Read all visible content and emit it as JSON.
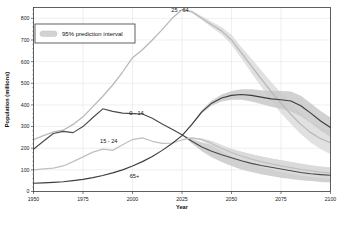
{
  "chart_data": {
    "type": "line",
    "title": "",
    "xlabel": "Year",
    "ylabel": "Population (millions)",
    "xlim": [
      1950,
      2100
    ],
    "ylim": [
      0,
      850
    ],
    "xticks": [
      1950,
      1975,
      2000,
      2025,
      2050,
      2075,
      2100
    ],
    "yticks": [
      0,
      100,
      200,
      300,
      400,
      500,
      600,
      700,
      800
    ],
    "grid": true,
    "legend": {
      "position": "top-left",
      "entries": [
        {
          "label": "95% prediction interval",
          "swatch_color": "#d2d2d2",
          "type": "band"
        }
      ]
    },
    "forecast_start": 2024,
    "annotations": [
      {
        "text": "25 - 64",
        "x": 2024,
        "y": 830,
        "series": "25 - 64"
      },
      {
        "text": "0 - 14",
        "x": 2002,
        "y": 352,
        "series": "0 - 14"
      },
      {
        "text": "15 - 24",
        "x": 1988,
        "y": 222,
        "series": "15 - 24"
      },
      {
        "text": "65+",
        "x": 2001,
        "y": 62,
        "series": "65+"
      }
    ],
    "x": [
      1950,
      1955,
      1960,
      1965,
      1970,
      1975,
      1980,
      1985,
      1990,
      1995,
      2000,
      2005,
      2010,
      2015,
      2020,
      2025,
      2030,
      2035,
      2040,
      2045,
      2050,
      2055,
      2060,
      2065,
      2070,
      2075,
      2080,
      2085,
      2090,
      2095,
      2100
    ],
    "series": [
      {
        "name": "25 - 64",
        "color": "#b8b8b8",
        "values": [
          240,
          258,
          275,
          283,
          310,
          345,
          392,
          440,
          492,
          552,
          618,
          655,
          700,
          748,
          800,
          840,
          830,
          800,
          770,
          742,
          700,
          640,
          580,
          520,
          462,
          408,
          356,
          310,
          272,
          244,
          225
        ],
        "lower": [
          null,
          null,
          null,
          null,
          null,
          null,
          null,
          null,
          null,
          null,
          null,
          null,
          null,
          null,
          null,
          840,
          825,
          792,
          758,
          725,
          678,
          614,
          548,
          484,
          420,
          362,
          312,
          266,
          226,
          196,
          172
        ],
        "upper": [
          null,
          null,
          null,
          null,
          null,
          null,
          null,
          null,
          null,
          null,
          null,
          null,
          null,
          null,
          null,
          840,
          836,
          810,
          784,
          760,
          724,
          668,
          614,
          560,
          506,
          456,
          406,
          360,
          322,
          296,
          280
        ]
      },
      {
        "name": "0 - 14",
        "color": "#4a4a4a",
        "values": [
          195,
          232,
          268,
          278,
          272,
          300,
          342,
          382,
          370,
          362,
          360,
          358,
          338,
          312,
          288,
          262,
          232,
          206,
          186,
          170,
          156,
          142,
          130,
          120,
          112,
          104,
          96,
          88,
          82,
          78,
          75
        ],
        "lower": [
          null,
          null,
          null,
          null,
          null,
          null,
          null,
          null,
          null,
          null,
          null,
          null,
          null,
          null,
          null,
          262,
          222,
          186,
          158,
          136,
          118,
          102,
          90,
          80,
          72,
          64,
          58,
          52,
          48,
          44,
          42
        ],
        "upper": [
          null,
          null,
          null,
          null,
          null,
          null,
          null,
          null,
          null,
          null,
          null,
          null,
          null,
          null,
          null,
          262,
          244,
          228,
          216,
          206,
          196,
          184,
          172,
          162,
          152,
          144,
          136,
          128,
          120,
          114,
          110
        ]
      },
      {
        "name": "15 - 24",
        "color": "#c0c0c0",
        "values": [
          100,
          104,
          108,
          118,
          138,
          160,
          182,
          196,
          190,
          216,
          240,
          248,
          232,
          222,
          224,
          238,
          248,
          240,
          222,
          200,
          180,
          164,
          150,
          138,
          128,
          118,
          110,
          102,
          96,
          90,
          86
        ],
        "lower": [
          null,
          null,
          null,
          null,
          null,
          null,
          null,
          null,
          null,
          null,
          null,
          null,
          null,
          null,
          null,
          238,
          246,
          234,
          212,
          186,
          162,
          142,
          126,
          112,
          100,
          90,
          82,
          74,
          68,
          62,
          58
        ],
        "upper": [
          null,
          null,
          null,
          null,
          null,
          null,
          null,
          null,
          null,
          null,
          null,
          null,
          null,
          null,
          null,
          238,
          250,
          246,
          234,
          216,
          198,
          184,
          172,
          162,
          152,
          144,
          136,
          128,
          122,
          116,
          112
        ]
      },
      {
        "name": "65+",
        "color": "#3d3d3d",
        "values": [
          38,
          40,
          42,
          45,
          50,
          56,
          64,
          74,
          86,
          100,
          118,
          138,
          162,
          190,
          222,
          258,
          310,
          368,
          408,
          432,
          444,
          448,
          444,
          436,
          428,
          424,
          418,
          396,
          362,
          326,
          296
        ],
        "lower": [
          null,
          null,
          null,
          null,
          null,
          null,
          null,
          null,
          null,
          null,
          null,
          null,
          null,
          null,
          null,
          258,
          306,
          360,
          396,
          416,
          424,
          424,
          416,
          404,
          392,
          382,
          370,
          348,
          316,
          282,
          252
        ],
        "upper": [
          null,
          null,
          null,
          null,
          null,
          null,
          null,
          null,
          null,
          null,
          null,
          null,
          null,
          null,
          null,
          258,
          314,
          376,
          420,
          448,
          464,
          472,
          472,
          468,
          464,
          464,
          462,
          442,
          408,
          372,
          342
        ]
      }
    ]
  }
}
